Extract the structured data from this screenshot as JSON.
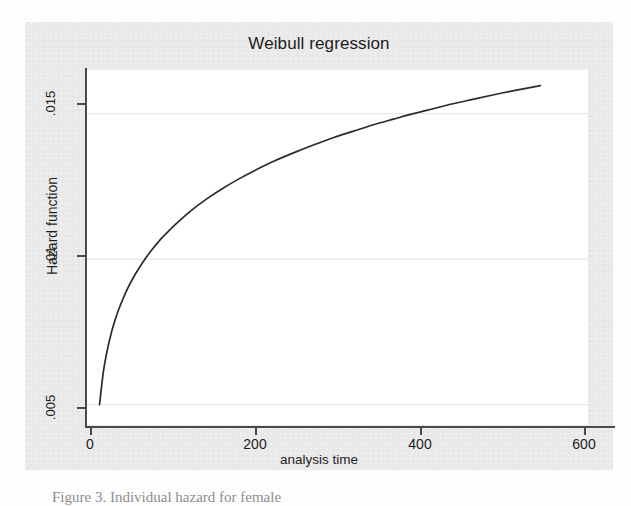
{
  "chart_data": {
    "type": "line",
    "title": "Weibull regression",
    "xlabel": "analysis time",
    "ylabel": "Hazard function",
    "xlim": [
      -12,
      620
    ],
    "ylim": [
      0.0043,
      0.0165
    ],
    "xticks": [
      0,
      200,
      400,
      600
    ],
    "xticklabels": [
      "0",
      "200",
      "400",
      "600"
    ],
    "yticks": [
      0.005,
      0.01,
      0.015
    ],
    "yticklabels": [
      ".005",
      ".01",
      ".015"
    ],
    "grid": "horizontal",
    "legend": "none",
    "series": [
      {
        "name": "Hazard function",
        "x": [
          5,
          10,
          15,
          20,
          25,
          30,
          40,
          50,
          60,
          70,
          80,
          90,
          100,
          120,
          140,
          160,
          180,
          200,
          225,
          250,
          275,
          300,
          325,
          350,
          375,
          400,
          425,
          450,
          475,
          500,
          525,
          560
        ],
        "y": [
          0.005,
          0.00615,
          0.0069,
          0.00748,
          0.00794,
          0.00833,
          0.00897,
          0.00948,
          0.00991,
          0.01029,
          0.01062,
          0.01091,
          0.01118,
          0.01166,
          0.01207,
          0.01243,
          0.01275,
          0.01304,
          0.01337,
          0.01366,
          0.01393,
          0.01418,
          0.0144,
          0.01462,
          0.01481,
          0.015,
          0.01517,
          0.01534,
          0.01549,
          0.01564,
          0.01578,
          0.01596
        ]
      }
    ]
  },
  "chart": {
    "title": "Weibull regression",
    "x_axis": {
      "title": "analysis time",
      "ticks": [
        {
          "label": "0",
          "value": 0
        },
        {
          "label": "200",
          "value": 200
        },
        {
          "label": "400",
          "value": 400
        },
        {
          "label": "600",
          "value": 600
        }
      ]
    },
    "y_axis": {
      "title": "Hazard function",
      "ticks": [
        {
          "label": ".015",
          "value": 0.015
        },
        {
          "label": ".01",
          "value": 0.01
        },
        {
          "label": ".005",
          "value": 0.005
        }
      ]
    },
    "colors": {
      "curve": "#2b2b2b",
      "axis": "#4a4a4a",
      "gridline": "#e3e3ea",
      "panel_background": "#e9e9e9",
      "plot_background": "#ffffff"
    }
  },
  "caption": {
    "text": "Figure 3. Individual hazard for female"
  }
}
